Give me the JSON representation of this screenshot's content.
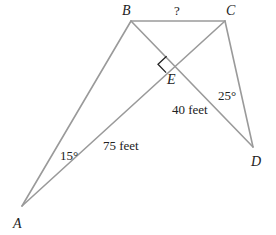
{
  "figure": {
    "type": "geometry-diagram",
    "vertices": {
      "A": {
        "label": "A",
        "x": 22,
        "y": 206
      },
      "B": {
        "label": "B",
        "x": 131,
        "y": 21
      },
      "C": {
        "label": "C",
        "x": 225,
        "y": 21
      },
      "D": {
        "label": "D",
        "x": 253,
        "y": 147
      },
      "E": {
        "label": "E",
        "x": 175,
        "y": 65
      }
    },
    "segments": [
      {
        "from": "A",
        "to": "B"
      },
      {
        "from": "A",
        "to": "C"
      },
      {
        "from": "B",
        "to": "C"
      },
      {
        "from": "B",
        "to": "D"
      },
      {
        "from": "C",
        "to": "D"
      }
    ],
    "labels": {
      "bc_unknown": "?",
      "ae_length": "75 feet",
      "ed_length": "40 feet",
      "angle_a": "15°",
      "angle_d": "25°"
    },
    "right_angle_at": "E",
    "colors": {
      "line": "#9a9a9a",
      "text": "#222222",
      "background": "#ffffff"
    }
  }
}
